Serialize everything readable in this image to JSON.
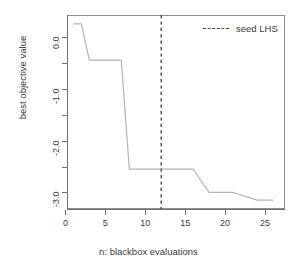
{
  "chart_data": {
    "type": "line",
    "title": "",
    "xlabel": "n: blackbox evaluations",
    "ylabel": "best objective value",
    "xlim": [
      0.2,
      27.5
    ],
    "ylim": [
      -3.32,
      0.42
    ],
    "grid": false,
    "xticks": [
      0,
      5,
      10,
      15,
      20,
      25
    ],
    "xtick_labels": [
      "0",
      "5",
      "10",
      "15",
      "20",
      "25"
    ],
    "yticks": [
      0.0,
      -0.5,
      -1.0,
      -1.5,
      -2.0,
      -2.5,
      -3.0
    ],
    "ytick_labels": [
      "0.0",
      "",
      "-1.0",
      "",
      "-2.0",
      "",
      "-3.0"
    ],
    "series": [
      {
        "name": "best objective value",
        "type": "step",
        "color": "#b4b4b4",
        "x": [
          1,
          2,
          3,
          4,
          5,
          6,
          7,
          8,
          9,
          10,
          11,
          12,
          13,
          14,
          15,
          16,
          17,
          18,
          19,
          20,
          21,
          22,
          23,
          24,
          25,
          26
        ],
        "y": [
          0.25,
          0.25,
          -0.45,
          -0.45,
          -0.45,
          -0.45,
          -0.45,
          -2.55,
          -2.55,
          -2.55,
          -2.55,
          -2.55,
          -2.55,
          -2.55,
          -2.55,
          -2.55,
          -2.78,
          -3.0,
          -3.0,
          -3.0,
          -3.0,
          -3.05,
          -3.1,
          -3.15,
          -3.15,
          -3.15
        ]
      }
    ],
    "annotations": [
      {
        "name": "seed-lhs-vline",
        "type": "vline",
        "x": 12,
        "style": "dashed",
        "color": "#4a4a4a",
        "label": "seed LHS"
      }
    ],
    "legend": {
      "position": "top-right",
      "entries": [
        {
          "label": "seed LHS",
          "style": "dashed",
          "color": "#4a4a4a"
        }
      ]
    }
  },
  "legend": {
    "seed_lhs_label": "seed LHS"
  },
  "axes": {
    "x_title": "n: blackbox evaluations",
    "y_title": "best objective value"
  }
}
